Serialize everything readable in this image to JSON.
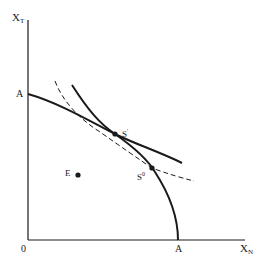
{
  "diagram": {
    "axes": {
      "y_label_main": "X",
      "y_label_sub": "T",
      "x_label_main": "X",
      "x_label_sub": "N",
      "origin_label": "0",
      "y_intercept_label": "A",
      "x_intercept_label": "A"
    },
    "points": {
      "s_prime": {
        "label": "S",
        "mark": "'"
      },
      "s_double_prime": {
        "label": "S",
        "mark": "0"
      },
      "e": {
        "label": "E"
      }
    },
    "curves": [
      {
        "name": "flat-solid-curve",
        "style": "solid"
      },
      {
        "name": "steep-solid-curve",
        "style": "solid"
      },
      {
        "name": "dashed-curve",
        "style": "dashed"
      }
    ],
    "colors": {
      "ink": "#1a1a1a",
      "background": "#ffffff"
    }
  }
}
